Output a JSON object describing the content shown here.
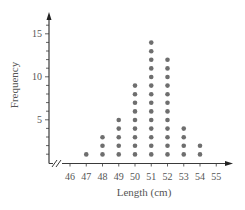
{
  "chart_data": {
    "type": "dot",
    "title": "",
    "xlabel": "Length (cm)",
    "ylabel": "Frequency",
    "categories": [
      46,
      47,
      48,
      49,
      50,
      51,
      52,
      53,
      54,
      55
    ],
    "values": [
      0,
      1,
      3,
      5,
      9,
      14,
      12,
      4,
      2,
      0
    ],
    "x_tick_labels": [
      "46",
      "47",
      "48",
      "49",
      "50",
      "51",
      "52",
      "53",
      "54",
      "55"
    ],
    "y_tick_labels": [
      "5",
      "10",
      "15"
    ],
    "ylim": [
      0,
      17
    ],
    "grid": false,
    "legend": null,
    "x_axis_break": true,
    "dot_color": "#6e6e6e",
    "axis_color": "#3a3a3a"
  }
}
